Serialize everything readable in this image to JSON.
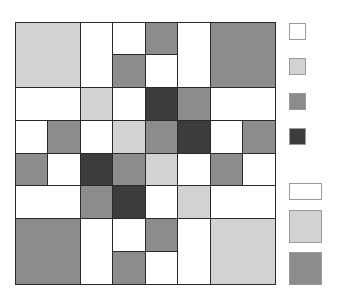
{
  "palette": {
    "white": "#ffffff",
    "light": "#d2d2d2",
    "mid": "#8c8c8c",
    "dark": "#3c3c3c"
  },
  "grid": {
    "rows": 8,
    "cols": 8,
    "tiles": [
      {
        "r": 0,
        "c": 0,
        "w": 2,
        "h": 2,
        "color": "light"
      },
      {
        "r": 0,
        "c": 2,
        "w": 1,
        "h": 2,
        "color": "white"
      },
      {
        "r": 0,
        "c": 3,
        "w": 1,
        "h": 1,
        "color": "white"
      },
      {
        "r": 1,
        "c": 3,
        "w": 1,
        "h": 1,
        "color": "mid"
      },
      {
        "r": 0,
        "c": 4,
        "w": 1,
        "h": 1,
        "color": "mid"
      },
      {
        "r": 1,
        "c": 4,
        "w": 1,
        "h": 1,
        "color": "white"
      },
      {
        "r": 0,
        "c": 5,
        "w": 1,
        "h": 2,
        "color": "white"
      },
      {
        "r": 0,
        "c": 6,
        "w": 2,
        "h": 2,
        "color": "mid"
      },
      {
        "r": 2,
        "c": 0,
        "w": 2,
        "h": 1,
        "color": "white"
      },
      {
        "r": 2,
        "c": 2,
        "w": 1,
        "h": 1,
        "color": "light"
      },
      {
        "r": 2,
        "c": 3,
        "w": 1,
        "h": 1,
        "color": "white"
      },
      {
        "r": 2,
        "c": 4,
        "w": 1,
        "h": 1,
        "color": "dark"
      },
      {
        "r": 2,
        "c": 5,
        "w": 1,
        "h": 1,
        "color": "mid"
      },
      {
        "r": 2,
        "c": 6,
        "w": 2,
        "h": 1,
        "color": "white"
      },
      {
        "r": 3,
        "c": 0,
        "w": 1,
        "h": 1,
        "color": "white"
      },
      {
        "r": 3,
        "c": 1,
        "w": 1,
        "h": 1,
        "color": "mid"
      },
      {
        "r": 3,
        "c": 2,
        "w": 1,
        "h": 1,
        "color": "white"
      },
      {
        "r": 3,
        "c": 3,
        "w": 1,
        "h": 1,
        "color": "light"
      },
      {
        "r": 3,
        "c": 4,
        "w": 1,
        "h": 1,
        "color": "mid"
      },
      {
        "r": 3,
        "c": 5,
        "w": 1,
        "h": 1,
        "color": "dark"
      },
      {
        "r": 3,
        "c": 6,
        "w": 1,
        "h": 1,
        "color": "white"
      },
      {
        "r": 3,
        "c": 7,
        "w": 1,
        "h": 1,
        "color": "mid"
      },
      {
        "r": 4,
        "c": 0,
        "w": 1,
        "h": 1,
        "color": "mid"
      },
      {
        "r": 4,
        "c": 1,
        "w": 1,
        "h": 1,
        "color": "white"
      },
      {
        "r": 4,
        "c": 2,
        "w": 1,
        "h": 1,
        "color": "dark"
      },
      {
        "r": 4,
        "c": 3,
        "w": 1,
        "h": 1,
        "color": "mid"
      },
      {
        "r": 4,
        "c": 4,
        "w": 1,
        "h": 1,
        "color": "light"
      },
      {
        "r": 4,
        "c": 5,
        "w": 1,
        "h": 1,
        "color": "white"
      },
      {
        "r": 4,
        "c": 6,
        "w": 1,
        "h": 1,
        "color": "mid"
      },
      {
        "r": 4,
        "c": 7,
        "w": 1,
        "h": 1,
        "color": "white"
      },
      {
        "r": 5,
        "c": 0,
        "w": 2,
        "h": 1,
        "color": "white"
      },
      {
        "r": 5,
        "c": 2,
        "w": 1,
        "h": 1,
        "color": "mid"
      },
      {
        "r": 5,
        "c": 3,
        "w": 1,
        "h": 1,
        "color": "dark"
      },
      {
        "r": 5,
        "c": 4,
        "w": 1,
        "h": 1,
        "color": "white"
      },
      {
        "r": 5,
        "c": 5,
        "w": 1,
        "h": 1,
        "color": "light"
      },
      {
        "r": 5,
        "c": 6,
        "w": 2,
        "h": 1,
        "color": "white"
      },
      {
        "r": 6,
        "c": 0,
        "w": 2,
        "h": 2,
        "color": "mid"
      },
      {
        "r": 6,
        "c": 2,
        "w": 1,
        "h": 2,
        "color": "white"
      },
      {
        "r": 6,
        "c": 3,
        "w": 1,
        "h": 1,
        "color": "white"
      },
      {
        "r": 7,
        "c": 3,
        "w": 1,
        "h": 1,
        "color": "mid"
      },
      {
        "r": 6,
        "c": 4,
        "w": 1,
        "h": 1,
        "color": "mid"
      },
      {
        "r": 7,
        "c": 4,
        "w": 1,
        "h": 1,
        "color": "white"
      },
      {
        "r": 6,
        "c": 5,
        "w": 1,
        "h": 2,
        "color": "white"
      },
      {
        "r": 6,
        "c": 6,
        "w": 2,
        "h": 2,
        "color": "light"
      }
    ]
  },
  "legend": {
    "items": [
      {
        "x": 289,
        "y": 23,
        "w": 17,
        "h": 17,
        "color": "white"
      },
      {
        "x": 289,
        "y": 58,
        "w": 17,
        "h": 17,
        "color": "light"
      },
      {
        "x": 289,
        "y": 93,
        "w": 17,
        "h": 17,
        "color": "mid"
      },
      {
        "x": 289,
        "y": 128,
        "w": 17,
        "h": 17,
        "color": "dark"
      },
      {
        "x": 289,
        "y": 183,
        "w": 33,
        "h": 17,
        "color": "white"
      },
      {
        "x": 289,
        "y": 210,
        "w": 33,
        "h": 33,
        "color": "light"
      },
      {
        "x": 289,
        "y": 252,
        "w": 33,
        "h": 33,
        "color": "mid"
      }
    ]
  }
}
